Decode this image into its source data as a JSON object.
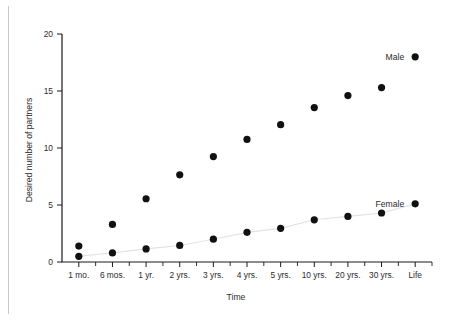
{
  "chart_data": {
    "type": "scatter",
    "title": "",
    "xlabel": "Time",
    "ylabel": "Desired number of partners",
    "categories": [
      "1 mo.",
      "6 mos.",
      "1 yr.",
      "2 yrs.",
      "3 yrs.",
      "4 yrs.",
      "5 yrs.",
      "10 yrs.",
      "20 yrs.",
      "30 yrs.",
      "Life"
    ],
    "yticks": [
      "0",
      "5",
      "10",
      "15",
      "20"
    ],
    "ytick_values": [
      0,
      5,
      10,
      15,
      20
    ],
    "ylim": [
      0,
      20
    ],
    "grid": false,
    "legend_position": "inline-right",
    "series": [
      {
        "name": "Male",
        "values": [
          1.4,
          3.3,
          5.55,
          7.65,
          9.25,
          10.75,
          12.05,
          13.55,
          14.6,
          15.3,
          18.0
        ]
      },
      {
        "name": "Female",
        "values": [
          0.5,
          0.8,
          1.15,
          1.45,
          2.0,
          2.6,
          2.95,
          3.7,
          4.0,
          4.3,
          5.1
        ]
      }
    ],
    "annotations": [
      {
        "text": "Male",
        "series": "Male"
      },
      {
        "text": "Female",
        "series": "Female"
      }
    ]
  }
}
